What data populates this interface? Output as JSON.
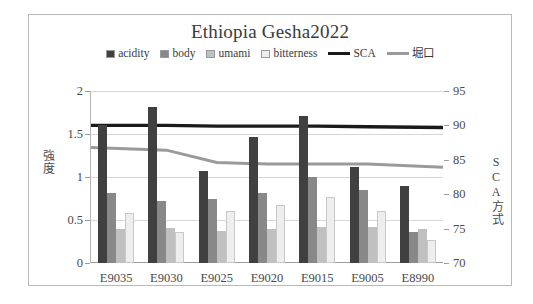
{
  "chart_data": {
    "type": "bar",
    "title": "Ethiopia Gesha2022",
    "categories": [
      "E9035",
      "E9030",
      "E9025",
      "E9020",
      "E9015",
      "E9005",
      "E8990"
    ],
    "xlabel": "",
    "ylabel": "強度",
    "y2label": "SCA方式",
    "ylim": [
      0,
      2
    ],
    "y2lim": [
      70,
      95
    ],
    "yticks": [
      "0",
      "0.5",
      "1",
      "1.5",
      "2"
    ],
    "y2ticks": [
      "70",
      "75",
      "80",
      "85",
      "90",
      "95"
    ],
    "grid": true,
    "legend_position": "top",
    "series": [
      {
        "name": "acidity",
        "kind": "bar",
        "axis": "left",
        "color": "#404040",
        "values": [
          1.6,
          1.81,
          1.07,
          1.47,
          1.71,
          1.12,
          0.9
        ]
      },
      {
        "name": "body",
        "kind": "bar",
        "axis": "left",
        "color": "#888888",
        "values": [
          0.81,
          0.72,
          0.75,
          0.81,
          1.0,
          0.85,
          0.36
        ]
      },
      {
        "name": "umami",
        "kind": "bar",
        "axis": "left",
        "color": "#c0c0c0",
        "values": [
          0.4,
          0.41,
          0.37,
          0.39,
          0.42,
          0.42,
          0.39
        ]
      },
      {
        "name": "bitterness",
        "kind": "bar",
        "axis": "left",
        "color": "#eeeeee",
        "values": [
          0.58,
          0.36,
          0.61,
          0.67,
          0.77,
          0.6,
          0.27
        ]
      },
      {
        "name": "SCA",
        "kind": "line",
        "axis": "right",
        "color": "#1a1a1a",
        "values": [
          90.0,
          90.0,
          89.9,
          89.9,
          89.9,
          89.8,
          89.7
        ]
      },
      {
        "name": "堀口",
        "kind": "line",
        "axis": "right",
        "color": "#9a9a9a",
        "values": [
          86.8,
          86.4,
          84.6,
          84.4,
          84.4,
          84.4,
          83.9
        ]
      }
    ]
  },
  "legend": {
    "items": [
      {
        "label": "acidity",
        "type": "bar",
        "color": "#404040"
      },
      {
        "label": "body",
        "type": "bar",
        "color": "#888888"
      },
      {
        "label": "umami",
        "type": "bar",
        "color": "#c0c0c0"
      },
      {
        "label": "bitterness",
        "type": "bar",
        "color": "#eeeeee"
      },
      {
        "label": "SCA",
        "type": "line",
        "color": "#1a1a1a"
      },
      {
        "label": "堀口",
        "type": "line",
        "color": "#9a9a9a"
      }
    ]
  }
}
